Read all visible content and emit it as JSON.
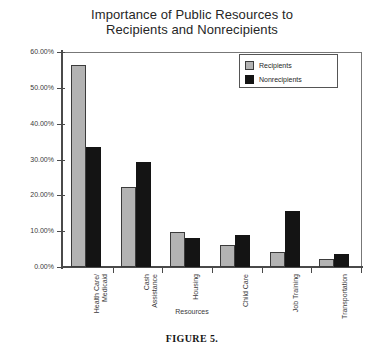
{
  "figure": {
    "caption": "FIGURE 5."
  },
  "chart_data": {
    "type": "bar",
    "title": "Importance of Public Resources to Recipients and Nonrecipients",
    "title_lines": [
      "Importance of Public Resources to",
      "Recipients and Nonrecipients"
    ],
    "xlabel": "Resources",
    "ylabel": "",
    "ylim": [
      0,
      60
    ],
    "ytick_values": [
      0,
      10,
      20,
      30,
      40,
      50,
      60
    ],
    "ytick_labels": [
      "0.00%",
      "10.00%",
      "20.00%",
      "30.00%",
      "40.00%",
      "50.00%",
      "60.00%"
    ],
    "grid": false,
    "legend_position": "top-right",
    "categories": [
      "Health Care/Medicaid",
      "Cash Assistance",
      "Housing",
      "Child Care",
      "Job Training",
      "Transportation"
    ],
    "category_label_lines": [
      [
        "Health Care/",
        "Medicaid"
      ],
      [
        "Cash",
        "Assistance"
      ],
      [
        "Housing"
      ],
      [
        "Child Care"
      ],
      [
        "Job Training"
      ],
      [
        "Transportation"
      ]
    ],
    "series": [
      {
        "name": "Recipients",
        "color": "#b3b3b3",
        "values": [
          56.5,
          22.3,
          9.8,
          6.1,
          4.2,
          2.2
        ]
      },
      {
        "name": "Nonrecipients",
        "color": "#141414",
        "values": [
          33.5,
          29.3,
          8.1,
          8.9,
          15.6,
          3.6
        ]
      }
    ]
  }
}
